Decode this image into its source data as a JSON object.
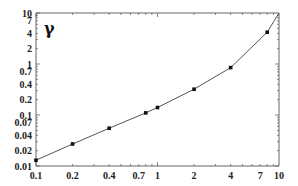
{
  "chart_data": {
    "type": "line",
    "title": "γ",
    "xlabel": "",
    "ylabel": "",
    "xscale": "log",
    "yscale": "log",
    "xlim": [
      0.1,
      10
    ],
    "ylim": [
      0.01,
      10
    ],
    "grid": false,
    "legend": null,
    "x_ticks": [
      "0.1",
      "0.2",
      "0.4",
      "0.7",
      "1",
      "2",
      "4",
      "7",
      "10"
    ],
    "y_ticks": [
      "0.01",
      "0.02",
      "0.04",
      "0.07",
      "0.1",
      "0.2",
      "0.4",
      "0.7",
      "1",
      "2",
      "4",
      "7",
      "10"
    ],
    "series": [
      {
        "name": "γ",
        "x": [
          0.1,
          0.2,
          0.4,
          0.8,
          1.0,
          2.0,
          4.0,
          8.0,
          10.0
        ],
        "y": [
          0.013,
          0.027,
          0.055,
          0.11,
          0.14,
          0.32,
          0.85,
          4.2,
          10.0
        ],
        "markers": [
          true,
          true,
          true,
          true,
          true,
          true,
          true,
          true,
          false
        ]
      }
    ]
  },
  "colors": {
    "line": "#555555",
    "marker": "#111111",
    "axis": "#666666"
  }
}
